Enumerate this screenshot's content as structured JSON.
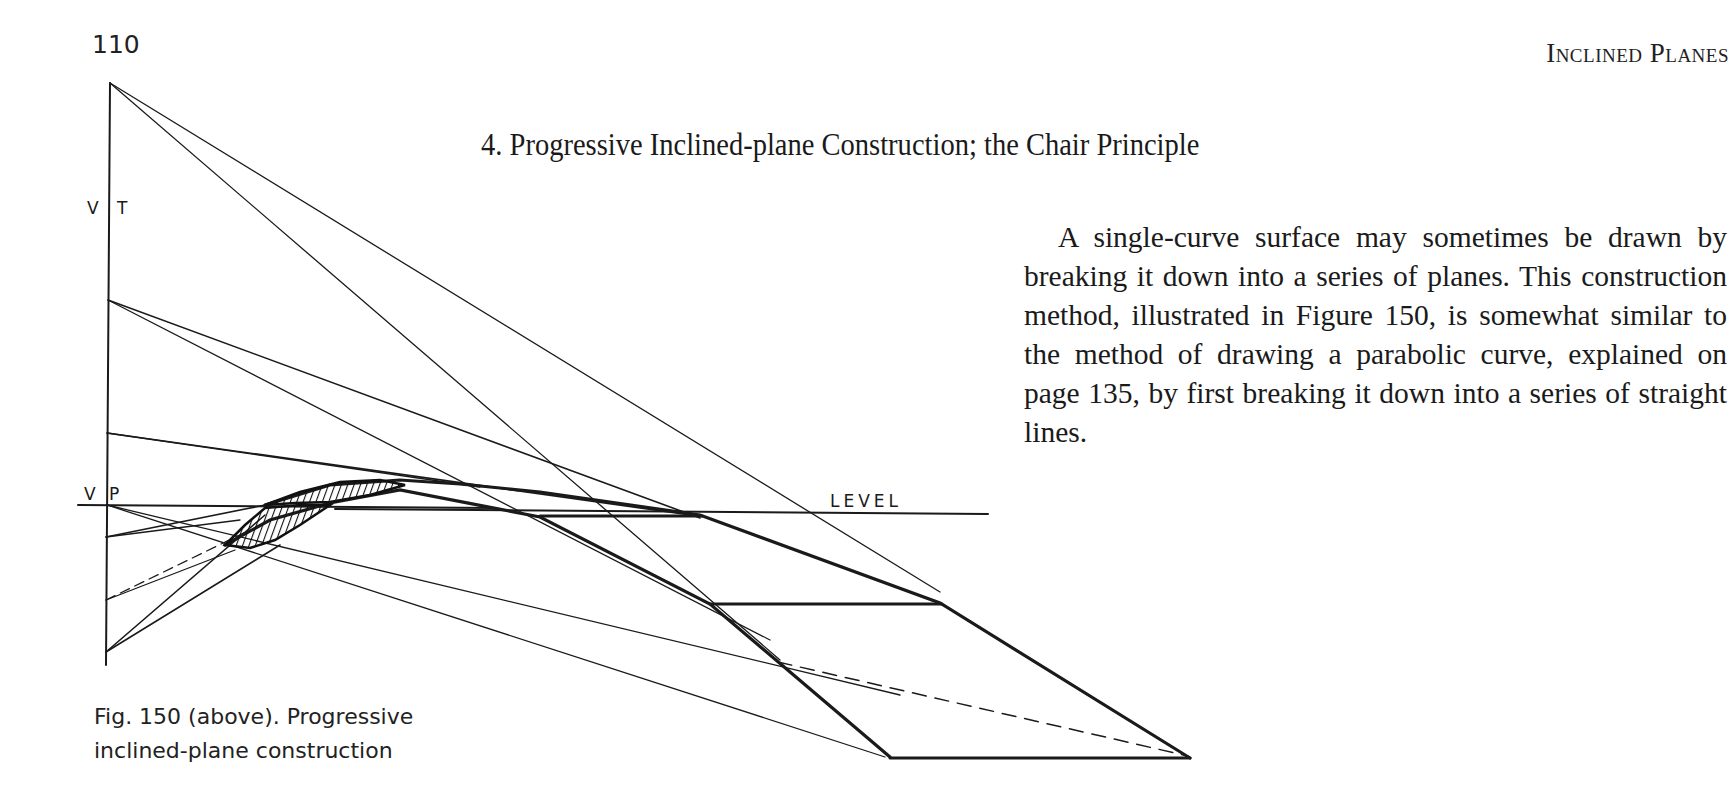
{
  "page": {
    "number": "110",
    "running_head": "Inclined Planes"
  },
  "section": {
    "title": "4. Progressive Inclined-plane Construction; the Chair Principle"
  },
  "body": {
    "paragraph": "A single-curve surface may sometimes be drawn by breaking it down into a series of planes. This construction method, illustrated in Figure 150, is somewhat similar to the method of drawing a parabolic curve, explained on page 135, by first breaking it down into a series of straight lines."
  },
  "figure": {
    "labels": {
      "vt_left": "V",
      "vt_right": "T",
      "vp_left": "V",
      "vp_right": "P",
      "level": "LEVEL"
    },
    "caption_line1": "Fig. 150 (above). Progressive",
    "caption_line2": "inclined-plane construction"
  }
}
